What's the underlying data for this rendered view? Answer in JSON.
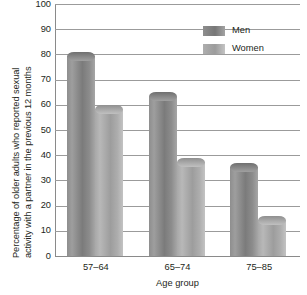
{
  "chart_data": {
    "type": "bar",
    "title": "",
    "subtitle": "",
    "xlabel": "Age group",
    "ylabel": "Percentage of older adults who reported sexual activity with a partner in the previous 12 months",
    "ylabel_lines": [
      "Percentage of older adults who reported sexual",
      "activity with a partner in the previous 12 months"
    ],
    "categories": [
      "57–64",
      "65–74",
      "75–85"
    ],
    "series": [
      {
        "name": "Men",
        "values": [
          81,
          65,
          37
        ],
        "color": "#808080"
      },
      {
        "name": "Women",
        "values": [
          60,
          39,
          16
        ],
        "color": "#ababab"
      }
    ],
    "ylim": [
      0,
      100
    ],
    "yticks": [
      0,
      10,
      20,
      30,
      40,
      50,
      60,
      70,
      80,
      90,
      100
    ],
    "ytick_labels": [
      "0",
      "10",
      "20",
      "30",
      "40",
      "50",
      "60",
      "70",
      "80",
      "90",
      "100"
    ],
    "grid": true,
    "grid_axis": "y",
    "legend_position": "top-right",
    "legend_entries": [
      "Men",
      "Women"
    ],
    "bar_style": "3d-cylinder",
    "background_color": "#ffffff",
    "gridline_color": "#9b9b9b",
    "text_color": "#231f20"
  }
}
